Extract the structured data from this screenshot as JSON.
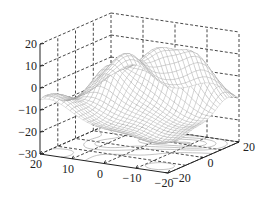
{
  "chart_data": {
    "type": "surface",
    "subtype": "mesh-with-contour",
    "title": "",
    "xlabel": "",
    "ylabel": "",
    "zlabel": "",
    "xlim": [
      -20,
      20
    ],
    "ylim": [
      -20,
      20
    ],
    "zlim": [
      -30,
      20
    ],
    "x_ticks": [
      20,
      10,
      0,
      -10,
      -20
    ],
    "x_tick_labels": [
      "20",
      "10",
      "0",
      "-10",
      "-20"
    ],
    "y_ticks": [
      -20,
      0,
      20
    ],
    "y_tick_labels": [
      "-20",
      "0",
      "20"
    ],
    "z_ticks": [
      20,
      10,
      0,
      -10,
      -20,
      -30
    ],
    "z_tick_labels": [
      "20",
      "10",
      "0",
      "-10",
      "-20",
      "-30"
    ],
    "grid": true,
    "grid_style": "dashed",
    "contour_plane_z": -30,
    "surface_description": "Multi-peak surface with peaks near z≈10–12 and a central depression near z≈-20",
    "surface_peaks": [
      {
        "x": 0,
        "y": 10,
        "z": 12
      },
      {
        "x": 10,
        "y": 0,
        "z": 10
      },
      {
        "x": -10,
        "y": 10,
        "z": 10
      },
      {
        "x": 10,
        "y": 15,
        "z": 8
      }
    ],
    "surface_valley": {
      "x": -10,
      "y": -5,
      "z": -22
    },
    "mesh_color": "#8a8a8a",
    "axis_color": "#222222"
  }
}
